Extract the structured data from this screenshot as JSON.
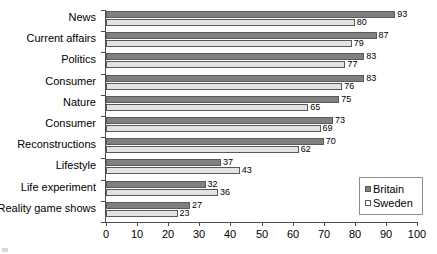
{
  "chart_data": {
    "type": "bar",
    "orientation": "horizontal",
    "title": "",
    "subtitle": "",
    "xlabel": "",
    "ylabel": "",
    "xlim": [
      0,
      100
    ],
    "xticks": [
      0,
      10,
      20,
      30,
      40,
      50,
      60,
      70,
      80,
      90,
      100
    ],
    "xtick_labels": [
      "0",
      "10",
      "20",
      "30",
      "40",
      "50",
      "60",
      "70",
      "80",
      "90",
      "100"
    ],
    "grid": false,
    "data_labels": true,
    "legend_position": "bottom-right",
    "categories": [
      "News",
      "Current affairs",
      "Politics",
      "Consumer",
      "Nature",
      "Consumer",
      "Reconstructions",
      "Lifestyle",
      "Life experiment",
      "Reality game shows"
    ],
    "series": [
      {
        "name": "Britain",
        "color": "#808080",
        "values": [
          93,
          87,
          83,
          83,
          75,
          73,
          70,
          37,
          32,
          27
        ]
      },
      {
        "name": "Sweden",
        "color": "#e3e3e3",
        "values": [
          80,
          79,
          77,
          76,
          65,
          69,
          62,
          43,
          36,
          23
        ]
      }
    ]
  },
  "legend": {
    "items": [
      {
        "label": "Britain",
        "swatch": "britain"
      },
      {
        "label": "Sweden",
        "swatch": "sweden"
      }
    ]
  }
}
